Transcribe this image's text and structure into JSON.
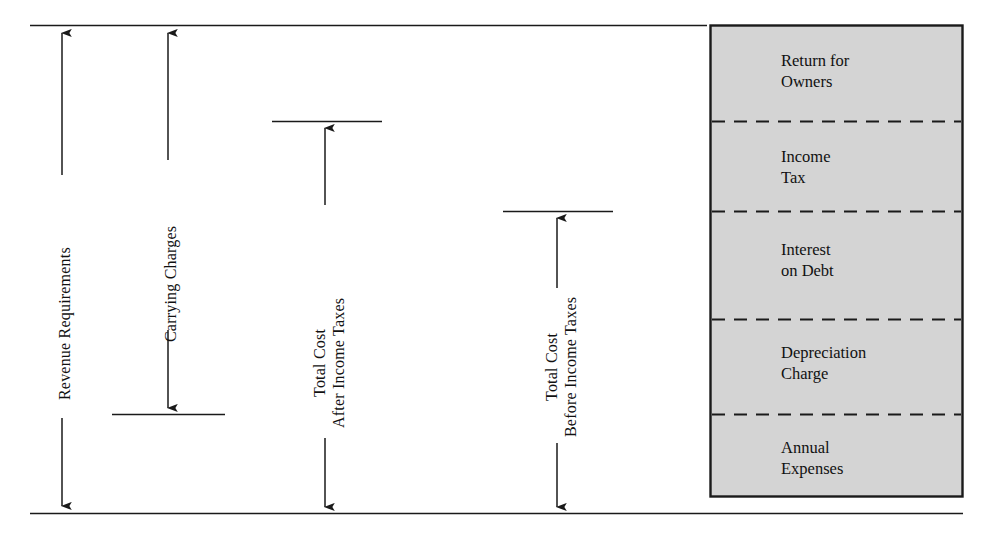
{
  "diagram": {
    "colors": {
      "line": "#1a1a1a",
      "text": "#111111",
      "box_fill": "#d4d4d4",
      "box_border": "#1a1a1a",
      "background": "#ffffff"
    },
    "brackets": [
      {
        "id": "revenue-requirements",
        "label": "Revenue Requirements",
        "label_lines": [
          "Revenue Requirements"
        ],
        "arrow_x": 62,
        "top_y": 25,
        "bottom_y": 513,
        "top_tick": {
          "x1": 30,
          "x2": 707
        },
        "bottom_tick": {
          "x1": 30,
          "x2": 707
        }
      },
      {
        "id": "carrying-charges",
        "label": "Carrying Charges",
        "label_lines": [
          "Carrying Charges"
        ],
        "arrow_x": 168,
        "top_y": 25,
        "bottom_y": 414,
        "top_tick": null,
        "bottom_tick": {
          "x1": 112,
          "x2": 225
        }
      },
      {
        "id": "total-cost-after-income-taxes",
        "label": "Total Cost After Income Taxes",
        "label_lines": [
          "Total Cost",
          "After Income Taxes"
        ],
        "arrow_x": 325,
        "top_y": 121,
        "bottom_y": 513,
        "top_tick": {
          "x1": 272,
          "x2": 382
        },
        "bottom_tick": null
      },
      {
        "id": "total-cost-before-income-taxes",
        "label": "Total Cost Before Income Taxes",
        "label_lines": [
          "Total Cost",
          "Before Income Taxes"
        ],
        "arrow_x": 557,
        "top_y": 211,
        "bottom_y": 513,
        "top_tick": {
          "x1": 503,
          "x2": 613
        },
        "bottom_tick": null
      }
    ],
    "stack_box": {
      "x": 710,
      "y": 25,
      "width": 253,
      "height": 472,
      "cells": [
        {
          "id": "return-for-owners",
          "lines": [
            "Return for",
            "Owners"
          ],
          "top_y": 25,
          "bottom_y": 121
        },
        {
          "id": "income-tax",
          "lines": [
            "Income",
            "Tax"
          ],
          "top_y": 121,
          "bottom_y": 211
        },
        {
          "id": "interest-on-debt",
          "lines": [
            "Interest",
            "on Debt"
          ],
          "top_y": 211,
          "bottom_y": 319
        },
        {
          "id": "depreciation-charge",
          "lines": [
            "Depreciation",
            "Charge"
          ],
          "top_y": 319,
          "bottom_y": 414
        },
        {
          "id": "annual-expenses",
          "lines": [
            "Annual",
            "Expenses"
          ],
          "top_y": 414,
          "bottom_y": 497
        }
      ],
      "dividers_y": [
        121,
        211,
        319,
        414
      ]
    }
  }
}
